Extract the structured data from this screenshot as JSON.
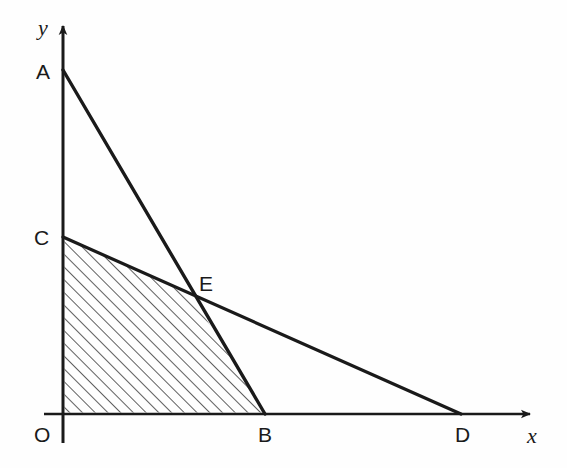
{
  "figure": {
    "kind": "coordinate-geometry-diagram",
    "background_color": "#fefefe",
    "stroke_color": "#1a1a1a",
    "hatch_color": "#1a1a1a",
    "axes": {
      "origin_label": "O",
      "x_axis_label": "x",
      "y_axis_label": "y",
      "origin_px": {
        "x": 63,
        "y": 414
      },
      "x_axis_tip_px": {
        "x": 537,
        "y": 414
      },
      "y_axis_tip_px": {
        "x": 63,
        "y": 19
      },
      "y_axis_bottom_px": {
        "x": 63,
        "y": 443
      },
      "arrowheads": [
        "x-positive",
        "y-positive"
      ]
    },
    "points": [
      {
        "name": "O",
        "label": "O",
        "px": {
          "x": 63,
          "y": 414
        },
        "label_px": {
          "x": 34,
          "y": 424
        },
        "on": "origin"
      },
      {
        "name": "A",
        "label": "A",
        "px": {
          "x": 63,
          "y": 70
        },
        "label_px": {
          "x": 36,
          "y": 61
        },
        "on": "y-axis"
      },
      {
        "name": "C",
        "label": "C",
        "px": {
          "x": 63,
          "y": 237
        },
        "label_px": {
          "x": 34,
          "y": 227
        },
        "on": "y-axis"
      },
      {
        "name": "B",
        "label": "B",
        "px": {
          "x": 265,
          "y": 414
        },
        "label_px": {
          "x": 258,
          "y": 424
        },
        "on": "x-axis"
      },
      {
        "name": "D",
        "label": "D",
        "px": {
          "x": 460,
          "y": 414
        },
        "label_px": {
          "x": 455,
          "y": 424
        },
        "on": "x-axis"
      },
      {
        "name": "E",
        "label": "E",
        "px": {
          "x": 192,
          "y": 296
        },
        "label_px": {
          "x": 199,
          "y": 273
        },
        "on": "intersection-of-AB-and-CD"
      }
    ],
    "segments": [
      {
        "name": "line-AB",
        "from": "A",
        "to": "B",
        "from_px": {
          "x": 63,
          "y": 70
        },
        "to_px": {
          "x": 265,
          "y": 414
        },
        "width": 3
      },
      {
        "name": "line-CD",
        "from": "C",
        "to": "D",
        "from_px": {
          "x": 63,
          "y": 237
        },
        "to_px": {
          "x": 460,
          "y": 414
        },
        "width": 3
      }
    ],
    "shaded_region": {
      "name": "region-OCEB",
      "vertices": [
        "O",
        "C",
        "E",
        "B"
      ],
      "polygon_px": [
        {
          "x": 63,
          "y": 414
        },
        {
          "x": 63,
          "y": 237
        },
        {
          "x": 192,
          "y": 296
        },
        {
          "x": 265,
          "y": 414
        }
      ],
      "fill_style": "diagonal-hatch",
      "hatch_angle_deg": 45,
      "hatch_spacing_px": 9,
      "hatch_line_width_px": 1.4
    }
  }
}
